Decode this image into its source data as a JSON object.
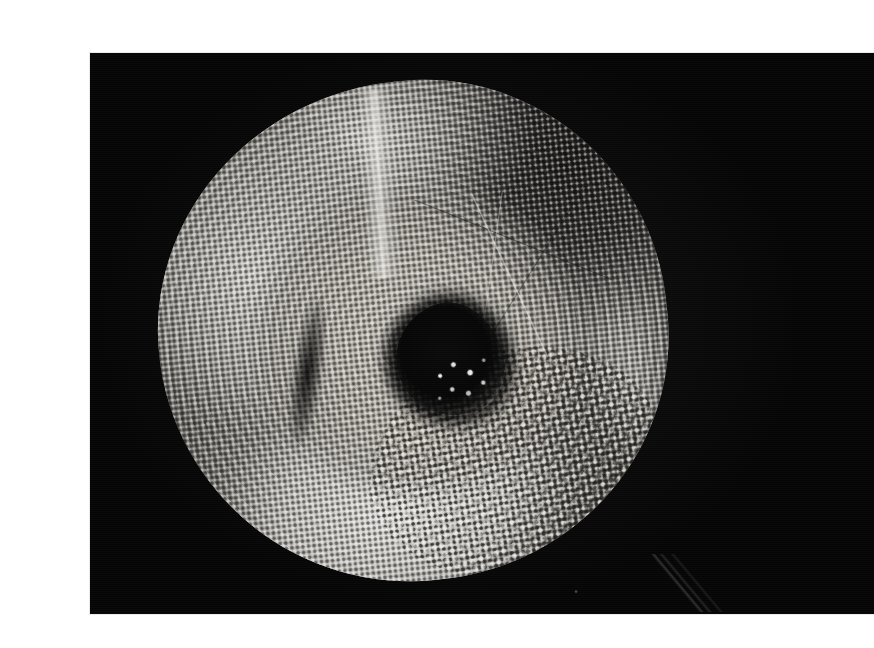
{
  "page": {
    "background_color": "#ffffff",
    "width": 851,
    "height": 648
  },
  "plate": {
    "kind": "halftone-photograph",
    "background_color": "#050505",
    "left": 50,
    "top": 37,
    "width": 784,
    "height": 561,
    "caption": "",
    "alt_text": "Black-and-white halftone photograph of a circular vessel-like object with a woven textured rim and a dark central cavity containing bright crystalline fragments, on a black background."
  },
  "subject": {
    "name": "circular vessel",
    "description": "Roughly circular, toroidal object resembling a woven or fibrous crucible. A bright, heavily dot-screened rim wraps the outside; a sandy mid-grey inner bowl slopes inward to an off-centre dark cavity filled with glinting crystalline or metallic fragments. The upper-right quadrant falls into deep shadow.",
    "center_x_pct": 40,
    "center_y_pct": 50,
    "diameter_pct": 64
  },
  "regions": [
    {
      "name": "outer-rim-highlight",
      "tone": "bright",
      "position": "lower-left and bottom"
    },
    {
      "name": "upper-rim-folds",
      "tone": "bright",
      "position": "top"
    },
    {
      "name": "shadowed-quadrant",
      "tone": "dark",
      "position": "upper-right"
    },
    {
      "name": "inner-bowl",
      "tone": "mid-grey",
      "position": "centre"
    },
    {
      "name": "central-cavity",
      "tone": "black",
      "position": "centre-right"
    },
    {
      "name": "crystalline-fragments",
      "tone": "specular-white",
      "position": "inside cavity"
    }
  ],
  "print_artifacts": {
    "halftone_dot_pitch_px": 5.6,
    "secondary_screen_angle_deg": 17,
    "coarse_screen_pitch_px": 8.2,
    "notes": "Visible rosette moire across the rim; coarse dot clusters at the bottom-right of the object."
  },
  "colors": {
    "paper": "#ffffff",
    "plate_black": "#050505",
    "highlight_white": "#fcfcfa",
    "midtone_grey": "#a8a59e",
    "shadow": "#0a0a0a"
  }
}
